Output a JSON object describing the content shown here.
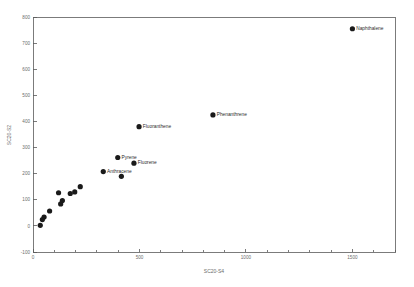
{
  "chart_data": {
    "type": "scatter",
    "title": "",
    "xlabel": "SC20-S4",
    "ylabel": "SC20-S2",
    "xlim": [
      0,
      1700
    ],
    "ylim": [
      -100,
      800
    ],
    "grid": false,
    "legend": "none",
    "xticks": [
      0,
      500,
      1000,
      1500
    ],
    "xtick_labels": [
      "0",
      "500",
      "1000",
      "1500"
    ],
    "yticks": [
      -100,
      0,
      100,
      200,
      300,
      400,
      500,
      600,
      700,
      800
    ],
    "ytick_labels": [
      "-100",
      "0",
      "100",
      "200",
      "300",
      "400",
      "500",
      "600",
      "700",
      "800"
    ],
    "points": [
      {
        "x": 1500,
        "y": 755,
        "label": "Naphthalene"
      },
      {
        "x": 845,
        "y": 425,
        "label": "Phenanthrene"
      },
      {
        "x": 498,
        "y": 380,
        "label": "Fluoranthene"
      },
      {
        "x": 398,
        "y": 262,
        "label": "Pyrene"
      },
      {
        "x": 474,
        "y": 240,
        "label": "Fluorene"
      },
      {
        "x": 330,
        "y": 208,
        "label": "Anthracene"
      },
      {
        "x": 415,
        "y": 190,
        "label": ""
      },
      {
        "x": 222,
        "y": 150,
        "label": ""
      },
      {
        "x": 196,
        "y": 130,
        "label": ""
      },
      {
        "x": 175,
        "y": 124,
        "label": ""
      },
      {
        "x": 120,
        "y": 127,
        "label": ""
      },
      {
        "x": 138,
        "y": 97,
        "label": ""
      },
      {
        "x": 130,
        "y": 84,
        "label": ""
      },
      {
        "x": 78,
        "y": 57,
        "label": ""
      },
      {
        "x": 52,
        "y": 34,
        "label": ""
      },
      {
        "x": 44,
        "y": 24,
        "label": ""
      },
      {
        "x": 34,
        "y": 2,
        "label": ""
      }
    ],
    "marker_size": 2.6,
    "marker_color": "#1a1a1a",
    "axis_color": "#5a5a5a",
    "text_color": "#6b6b6b"
  }
}
